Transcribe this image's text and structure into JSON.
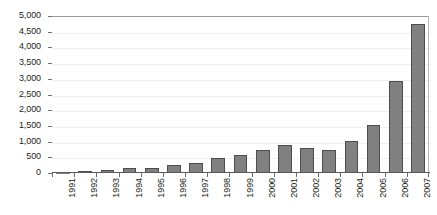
{
  "chart_data": {
    "type": "bar",
    "title": "",
    "subtitle": "",
    "xlabel": "",
    "ylabel": "",
    "categories": [
      "1991",
      "1992",
      "1993",
      "1994",
      "1995",
      "1996",
      "1997",
      "1998",
      "1999",
      "2000",
      "2001",
      "2002",
      "2003",
      "2004",
      "2005",
      "2006",
      "2007"
    ],
    "values": [
      5,
      60,
      100,
      170,
      175,
      255,
      315,
      475,
      565,
      725,
      880,
      785,
      725,
      1020,
      1515,
      2935,
      4750
    ],
    "series": [
      {
        "name": "Count",
        "values": [
          5,
          60,
          100,
          170,
          175,
          255,
          315,
          475,
          565,
          725,
          880,
          785,
          725,
          1020,
          1515,
          2935,
          4750
        ]
      }
    ],
    "ylim": [
      0,
      5000
    ],
    "ytick_step": 500,
    "ytick_labels": [
      "0",
      "500",
      "1,000",
      "1,500",
      "2,000",
      "2,500",
      "3,000",
      "3,500",
      "4,000",
      "4,500",
      "5,000"
    ],
    "ytick_values": [
      0,
      500,
      1000,
      1500,
      2000,
      2500,
      3000,
      3500,
      4000,
      4500,
      5000
    ],
    "xtick_labels": [
      "1991",
      "1992",
      "1993",
      "1994",
      "1995",
      "1996",
      "1997",
      "1998",
      "1999",
      "2000",
      "2001",
      "2002",
      "2003",
      "2004",
      "2005",
      "2006",
      "2007"
    ],
    "xtick_label_rotation": -90,
    "grid": true,
    "grid_axis": "y",
    "legend": false,
    "legend_position": "none",
    "annotations": [],
    "colors": {
      "bar_fill": "#808080",
      "bar_border": "#4d4d4d",
      "plot_background": "#ffffff",
      "axis_line": "#5a5a5a",
      "gridline": "#f0f0f0",
      "tick_label": "#231f20",
      "plot_border": "#9a9a9a"
    }
  }
}
